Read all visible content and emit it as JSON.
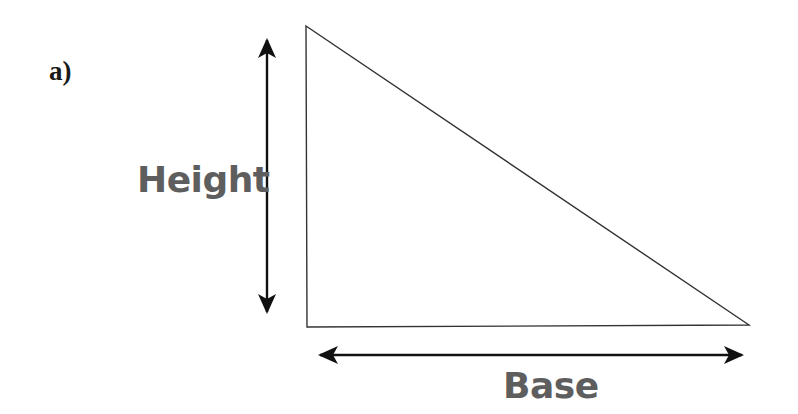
{
  "figure": {
    "part_label": "a)",
    "labels": {
      "height": "Height",
      "base": "Base"
    },
    "shape": "right-triangle",
    "colors": {
      "background": "#ffffff",
      "outline": "#333333",
      "arrows": "#111111",
      "label_text": "#5e5e5e",
      "part_label_text": "#1a1a1a"
    }
  }
}
